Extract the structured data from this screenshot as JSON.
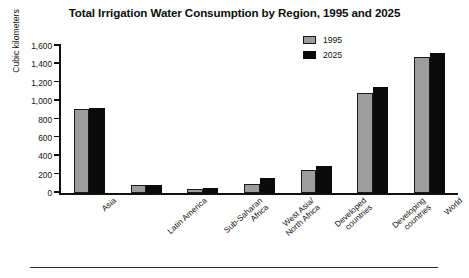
{
  "chart_data": {
    "type": "bar",
    "title": "Total Irrigation Water Consumption by Region, 1995 and 2025",
    "xlabel": "",
    "ylabel": "Cubic kilometers",
    "ylim": [
      0,
      1600
    ],
    "ytick_step": 200,
    "ytick_labels": [
      "1,600",
      "1,400",
      "1,200",
      "1,000",
      "800",
      "600",
      "400",
      "200",
      "0"
    ],
    "ytick_values": [
      1600,
      1400,
      1200,
      1000,
      800,
      600,
      400,
      200,
      0
    ],
    "grid": false,
    "legend_position": "top-right",
    "categories": [
      "Asia",
      "Latin America",
      "Sub-Saharan Africa",
      "West Asia/ North Africa",
      "Developed countries",
      "Developing countries",
      "World"
    ],
    "category_lines": [
      [
        "Asia"
      ],
      [
        "Latin America"
      ],
      [
        "Sub-Saharan",
        "Africa"
      ],
      [
        "West Asia/",
        "North Africa"
      ],
      [
        "Developed",
        "countries"
      ],
      [
        "Developing",
        "countries"
      ],
      [
        "World"
      ]
    ],
    "series": [
      {
        "name": "1995",
        "color": "#9d9d9d",
        "values": [
          910,
          85,
          45,
          100,
          255,
          1090,
          1480
        ]
      },
      {
        "name": "2025",
        "color": "#0a0a0a",
        "values": [
          920,
          90,
          50,
          160,
          290,
          1150,
          1520
        ]
      }
    ]
  },
  "legend": {
    "items": [
      {
        "label": "1995",
        "swatch": "gray-swatch"
      },
      {
        "label": "2025",
        "swatch": "black-swatch"
      }
    ]
  }
}
